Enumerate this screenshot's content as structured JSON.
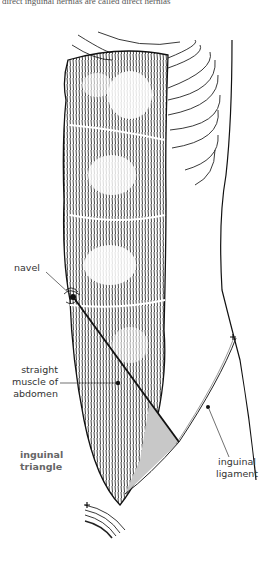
{
  "figure": {
    "top_caption_fragment": "direct inguinal hernias are called direct hernias",
    "colors": {
      "ink": "#111111",
      "triangle_fill": "#c8c8c8",
      "label_text": "#333333",
      "bold_label": "#666666"
    },
    "labels": {
      "navel": "navel",
      "straight_muscle_line1": "straight",
      "straight_muscle_line2": "muscle of",
      "straight_muscle_line3": "abdomen",
      "inguinal_triangle_line1": "inguinal",
      "inguinal_triangle_line2": "triangle",
      "inguinal_ligament_line1": "inguinal",
      "inguinal_ligament_line2": "ligament"
    }
  }
}
